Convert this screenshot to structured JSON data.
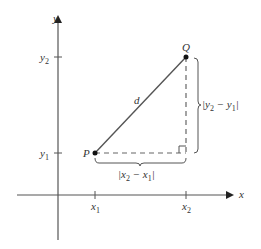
{
  "diagram": {
    "axes": {
      "x_label": "x",
      "y_label": "y"
    },
    "points": {
      "P": {
        "label": "P",
        "x_label": "x",
        "x_sub": "1",
        "y_label": "y",
        "y_sub": "1"
      },
      "Q": {
        "label": "Q",
        "x_label": "x",
        "x_sub": "2",
        "y_label": "y",
        "y_sub": "2"
      }
    },
    "segment_label": "d",
    "vertical_distance": {
      "pre": "|y",
      "sub1": "2",
      "mid": " − y",
      "sub2": "1",
      "post": "|"
    },
    "horizontal_distance": {
      "pre": "|x",
      "sub1": "2",
      "mid": " − x",
      "sub2": "1",
      "post": "|"
    },
    "colors": {
      "line": "#444444",
      "point": "#111111",
      "text": "#333333"
    }
  }
}
